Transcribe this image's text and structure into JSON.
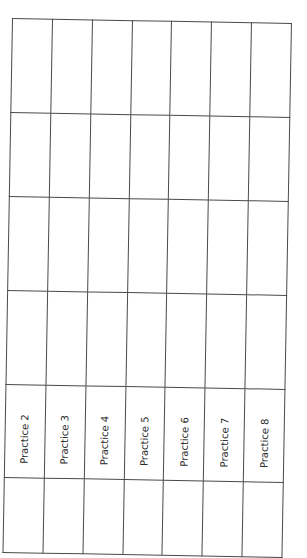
{
  "document": {
    "type": "practice-log-grid",
    "orientation": "rotated-90",
    "columns": 7,
    "rows": 6,
    "border_color": "#4a4a4a",
    "background": "#ffffff",
    "labels": [
      "Practice 2",
      "Practice 3",
      "Practice 4",
      "Practice 5",
      "Practice 6",
      "Practice 7",
      "Practice 8"
    ]
  }
}
